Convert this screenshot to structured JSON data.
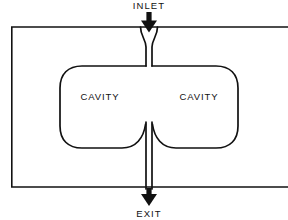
{
  "figure": {
    "background_color": "#ffffff",
    "line_color": "#111111",
    "text_color": "#111111",
    "width": 288,
    "height": 220
  },
  "labels": {
    "inlet": "INLET",
    "exit": "EXIT",
    "cavity_left": "CAVITY",
    "cavity_right": "CAVITY"
  },
  "diagram_data": {
    "type": "diagram",
    "description": "Cross-section of a housing containing two symmetric cavities fed by a central inlet channel from the top and drained by a central exit channel at the bottom.",
    "outer_body": {
      "shape": "rectangle",
      "x": 11,
      "y": 27,
      "width": 283,
      "height": 160,
      "right_edge_clipped": true
    },
    "inlet_channel": {
      "orientation": "vertical",
      "from_y": 27,
      "to_y": 64,
      "center_x": 149,
      "channel_width": 6,
      "flare": "top"
    },
    "exit_channel": {
      "orientation": "vertical",
      "from_y": 122,
      "to_y": 187,
      "center_x": 149,
      "channel_width": 6,
      "flare": "top"
    },
    "cavities": [
      {
        "name": "CAVITY",
        "side": "left",
        "x": 60,
        "y": 64,
        "width": 85,
        "height": 86,
        "corner_radius": 22
      },
      {
        "name": "CAVITY",
        "side": "right",
        "x": 153,
        "y": 64,
        "width": 85,
        "height": 86,
        "corner_radius": 22
      }
    ],
    "arrows": [
      {
        "name": "inlet-arrow",
        "direction": "down",
        "x": 149,
        "from_y": 12,
        "to_y": 30,
        "label": "INLET"
      },
      {
        "name": "exit-arrow",
        "direction": "down",
        "x": 149,
        "from_y": 188,
        "to_y": 205,
        "label": "EXIT"
      }
    ],
    "flow_direction": "top to bottom"
  }
}
